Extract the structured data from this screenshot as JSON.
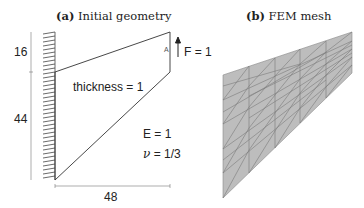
{
  "panel_a": {
    "caption_prefix": "(a)",
    "caption_text": "Initial geometry",
    "dim_top": "16",
    "dim_left": "44",
    "dim_bottom": "48",
    "point_label": "A",
    "force_label": "F = 1",
    "thickness_label": "thickness = 1",
    "e_label": "E = 1",
    "nu_symbol": "ν",
    "nu_value": " = 1/3"
  },
  "panel_b": {
    "caption_prefix": "(b)",
    "caption_text": "FEM mesh",
    "mesh_fill": "#bdbdbd",
    "mesh_line": "#7a7a7a"
  }
}
